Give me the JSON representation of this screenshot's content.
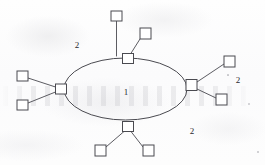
{
  "figure": {
    "background_color": "#fdfdfd",
    "stroke_color": "#4a4a50",
    "text_color": "#2a2a2e",
    "width": 265,
    "height": 165
  },
  "core": {
    "shape": "ellipse",
    "name": "backbone-ring",
    "cx": 125.5,
    "cy": 89,
    "rx": 61.5,
    "ry": 31,
    "label": "1"
  },
  "labels": [
    {
      "id": "label-level-1-core",
      "text": "1",
      "x": 126,
      "y": 92
    },
    {
      "id": "label-level-2-topleft",
      "text": "2",
      "x": 77,
      "y": 45
    },
    {
      "id": "label-level-2-right",
      "text": "2",
      "x": 238,
      "y": 80
    },
    {
      "id": "label-level-2-bottom",
      "text": "2",
      "x": 192,
      "y": 131
    }
  ],
  "hubs": [
    {
      "id": "hub-top",
      "name": "hub-node-top",
      "x": 122.5,
      "y": 53.5,
      "w": 11,
      "h": 10,
      "leaves": [
        {
          "id": "leaf-top-vertical",
          "name": "leaf-node-top-upper",
          "x": 111,
          "y": 11,
          "w": 11,
          "h": 10
        },
        {
          "id": "leaf-top-diagonal",
          "name": "leaf-node-top-right",
          "x": 140,
          "y": 28,
          "w": 11,
          "h": 11
        }
      ]
    },
    {
      "id": "hub-left",
      "name": "hub-node-left",
      "x": 55.5,
      "y": 84,
      "w": 11,
      "h": 10,
      "leaves": [
        {
          "id": "leaf-left-upper",
          "name": "leaf-node-left-upper",
          "x": 17,
          "y": 71,
          "w": 11,
          "h": 10
        },
        {
          "id": "leaf-left-lower",
          "name": "leaf-node-left-lower",
          "x": 17,
          "y": 100,
          "w": 11,
          "h": 10
        }
      ]
    },
    {
      "id": "hub-right",
      "name": "hub-node-right",
      "x": 186,
      "y": 79.5,
      "w": 11,
      "h": 11,
      "leaves": [
        {
          "id": "leaf-right-upper",
          "name": "leaf-node-right-upper",
          "x": 224,
          "y": 56,
          "w": 11,
          "h": 11
        },
        {
          "id": "leaf-right-lower",
          "name": "leaf-node-right-lower",
          "x": 216,
          "y": 94,
          "w": 11,
          "h": 11
        }
      ]
    },
    {
      "id": "hub-bottom",
      "name": "hub-node-bottom",
      "x": 122.5,
      "y": 121.5,
      "w": 11,
      "h": 10,
      "leaves": [
        {
          "id": "leaf-bottom-left",
          "name": "leaf-node-bottom-left",
          "x": 95,
          "y": 145,
          "w": 11,
          "h": 11
        },
        {
          "id": "leaf-bottom-right",
          "name": "leaf-node-bottom-right",
          "x": 143,
          "y": 145,
          "w": 11,
          "h": 11
        }
      ]
    }
  ],
  "connectors": [
    {
      "id": "link-top-vertical",
      "name": "connector-top-upper",
      "x1": 116.5,
      "y1": 21,
      "x2": 116.5,
      "y2": 56
    },
    {
      "id": "link-top-diagonal",
      "name": "connector-top-right",
      "x1": 140,
      "y1": 39,
      "x2": 128,
      "y2": 58
    },
    {
      "id": "link-left-upper",
      "name": "connector-left-upper",
      "x1": 28,
      "y1": 78,
      "x2": 55.5,
      "y2": 87
    },
    {
      "id": "link-left-lower",
      "name": "connector-left-lower",
      "x1": 28,
      "y1": 103,
      "x2": 55.5,
      "y2": 92
    },
    {
      "id": "link-right-upper",
      "name": "connector-right-upper",
      "x1": 224,
      "y1": 64,
      "x2": 197,
      "y2": 82
    },
    {
      "id": "link-right-lower",
      "name": "connector-right-lower",
      "x1": 216,
      "y1": 98,
      "x2": 197,
      "y2": 89
    },
    {
      "id": "link-bottom-left",
      "name": "connector-bottom-left",
      "x1": 106,
      "y1": 147,
      "x2": 124,
      "y2": 131.5
    },
    {
      "id": "link-bottom-right",
      "name": "connector-bottom-right",
      "x1": 143,
      "y1": 147,
      "x2": 131,
      "y2": 131.5
    }
  ],
  "specks": [
    {
      "x": 249,
      "y": 104,
      "r": 0.9
    },
    {
      "x": 258,
      "y": 152,
      "r": 0.8
    },
    {
      "x": 228,
      "y": 75,
      "r": 0.6
    }
  ]
}
